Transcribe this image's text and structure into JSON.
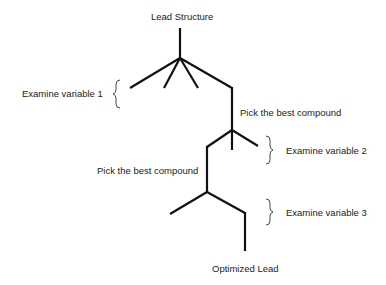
{
  "diagram": {
    "title": "Lead Structure",
    "result": "Optimized Lead",
    "steps": [
      {
        "label": "Examine variable 1"
      },
      {
        "label": "Pick the best compound"
      },
      {
        "label": "Examine variable 2"
      },
      {
        "label": "Pick the best compound"
      },
      {
        "label": "Examine variable 3"
      }
    ]
  }
}
